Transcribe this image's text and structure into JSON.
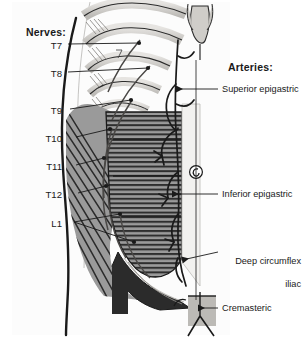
{
  "figure": {
    "title_nerves": "Nerves:",
    "title_arteries": "Arteries:",
    "background_color": "#ffffff",
    "ink_color": "#1a1a1a",
    "muscle_gray": "#9a9a9a",
    "sheath_gray": "#d8d6d2",
    "dark_fill": "#2b2b2b"
  },
  "nerves": {
    "heading": "Nerves:",
    "items": [
      {
        "label": "T7",
        "x": 62,
        "y": 47,
        "tip_x": 139,
        "tip_y": 43
      },
      {
        "label": "T8",
        "x": 62,
        "y": 75,
        "tip_x": 148,
        "tip_y": 68
      },
      {
        "label": "T9",
        "x": 62,
        "y": 112,
        "tip_x": 131,
        "tip_y": 100
      },
      {
        "label": "T10",
        "x": 62,
        "y": 140,
        "tip_x": 110,
        "tip_y": 129
      },
      {
        "label": "T11",
        "x": 62,
        "y": 168,
        "tip_x": 104,
        "tip_y": 158
      },
      {
        "label": "T12",
        "x": 62,
        "y": 196,
        "tip_x": 106,
        "tip_y": 186
      },
      {
        "label": "L1",
        "x": 62,
        "y": 225,
        "tip_x": 120,
        "tip_y": 214
      }
    ]
  },
  "arteries": {
    "heading": "Arteries:",
    "items": [
      {
        "label": "Superior epigastric",
        "x": 222,
        "y": 92,
        "arrow_x": 170,
        "arrow_y": 92,
        "wrap": false
      },
      {
        "label": "Inferior epigastric",
        "x": 222,
        "y": 197,
        "arrow_x": 163,
        "arrow_y": 197,
        "wrap": false
      },
      {
        "label": "Deep circumflex",
        "label2": "iliac",
        "x": 222,
        "y": 250,
        "arrow_x": 176,
        "arrow_y": 255,
        "wrap": true
      },
      {
        "label": "Cremasteric",
        "x": 222,
        "y": 311,
        "arrow_x": 192,
        "arrow_y": 311,
        "wrap": false
      }
    ]
  },
  "anatomy": {
    "umbilicus": "umbilicus-spiral",
    "ribs_count": 6,
    "spermatic_cord": "spermatic-cord"
  }
}
